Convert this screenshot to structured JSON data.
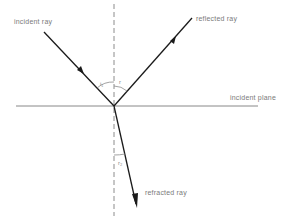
{
  "diagram": {
    "labels": {
      "incident_ray": "incident ray",
      "reflected_ray": "reflected ray",
      "incident_plane": "incident plane",
      "refracted_ray": "refracted ray"
    },
    "angles": {
      "incidence": "i₁",
      "reflection": "r",
      "refraction": "r₂"
    },
    "colors": {
      "ray": "#1a1a1a",
      "normal": "#8c8c8c",
      "plane": "#7a7a7a",
      "text": "#7a7a7a"
    }
  }
}
